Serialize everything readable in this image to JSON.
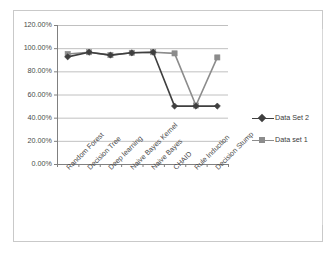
{
  "chart_data": {
    "type": "line",
    "title": "",
    "xlabel": "",
    "ylabel": "",
    "categories": [
      "Random Forest",
      "Decision Tree",
      "Deep learning",
      "Naive Bayes Kernel",
      "Naive Bayes",
      "CHAID",
      "Rule Induction",
      "Decision Stump"
    ],
    "series": [
      {
        "name": "Data Set 2",
        "marker": "diamond",
        "color": "#3f3f3f",
        "values": [
          0.925,
          0.965,
          0.94,
          0.96,
          0.965,
          0.5,
          0.5,
          0.5
        ]
      },
      {
        "name": "Data set 1",
        "marker": "square",
        "color": "#8c8c8c",
        "values": [
          0.95,
          0.965,
          0.94,
          0.96,
          0.965,
          0.955,
          0.505,
          0.92
        ]
      }
    ],
    "ylim": [
      0.0,
      1.2
    ],
    "yticks": [
      0.0,
      0.2,
      0.4,
      0.6,
      0.8,
      1.0,
      1.2
    ],
    "ytick_labels": [
      "0.00%",
      "20.00%",
      "40.00%",
      "60.00%",
      "80.00%",
      "100.00%",
      "120.00%"
    ],
    "grid": true,
    "grid_axis": "y",
    "legend_position": "right",
    "legend": [
      "Data Set 2",
      "Data set 1"
    ]
  },
  "colors": {
    "series_2": "#3f3f3f",
    "series_1": "#8c8c8c",
    "gridline": "#b0b0b0",
    "axis": "#808080",
    "frame_border": "#c9c9c9",
    "tick_text": "#4a4a4a",
    "plot_background": "#ffffff"
  }
}
